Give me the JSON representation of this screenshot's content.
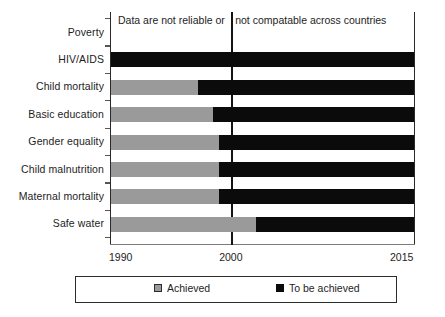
{
  "chart_data": {
    "type": "bar",
    "title": "",
    "subtitle": "",
    "xlabel": "",
    "ylabel": "",
    "orientation": "horizontal",
    "stacked": true,
    "grid": false,
    "xlim": [
      1990,
      2015
    ],
    "xticks": [
      1990,
      2000,
      2015
    ],
    "xtick_labels": [
      "1990",
      "2000",
      "2015"
    ],
    "reference_line": {
      "value": 2000,
      "label": "2000"
    },
    "legend": {
      "position": "bottom",
      "entries": [
        {
          "label": "Achieved",
          "color": "#9a9a9a"
        },
        {
          "label": "To be achieved",
          "color": "#0b0b0b"
        }
      ]
    },
    "annotation": {
      "full_text": "Data are not reliable or not compatable across countries",
      "left_part": "Data are not reliable or",
      "right_part": "not compatable across countries",
      "applies_to": "Poverty"
    },
    "categories": [
      "Poverty",
      "HIV/AIDS",
      "Child mortality",
      "Basic education",
      "Gender equality",
      "Child malnutrition",
      "Maternal mortality",
      "Safe water"
    ],
    "series": [
      {
        "name": "Achieved",
        "color": "#9a9a9a",
        "values": [
          null,
          0.0,
          1997.2,
          1998.4,
          1998.9,
          1998.9,
          1998.9,
          2002.0
        ]
      },
      {
        "name": "To be achieved",
        "color": "#0b0b0b",
        "values": [
          null,
          2015,
          2015,
          2015,
          2015,
          2015,
          2015,
          2015
        ]
      }
    ],
    "rows": [
      {
        "category": "Poverty",
        "achieved_to_year": null,
        "achieved_fraction": null,
        "note": "Data are not reliable or not compatable across countries"
      },
      {
        "category": "HIV/AIDS",
        "achieved_to_year": 1990.0,
        "achieved_fraction": 0.0
      },
      {
        "category": "Child mortality",
        "achieved_to_year": 1997.2,
        "achieved_fraction": 0.29
      },
      {
        "category": "Basic education",
        "achieved_to_year": 1998.4,
        "achieved_fraction": 0.34
      },
      {
        "category": "Gender equality",
        "achieved_to_year": 1998.9,
        "achieved_fraction": 0.356
      },
      {
        "category": "Child malnutrition",
        "achieved_to_year": 1998.9,
        "achieved_fraction": 0.356
      },
      {
        "category": "Maternal mortality",
        "achieved_to_year": 1998.9,
        "achieved_fraction": 0.356
      },
      {
        "category": "Safe water",
        "achieved_to_year": 2002.0,
        "achieved_fraction": 0.482
      }
    ]
  }
}
